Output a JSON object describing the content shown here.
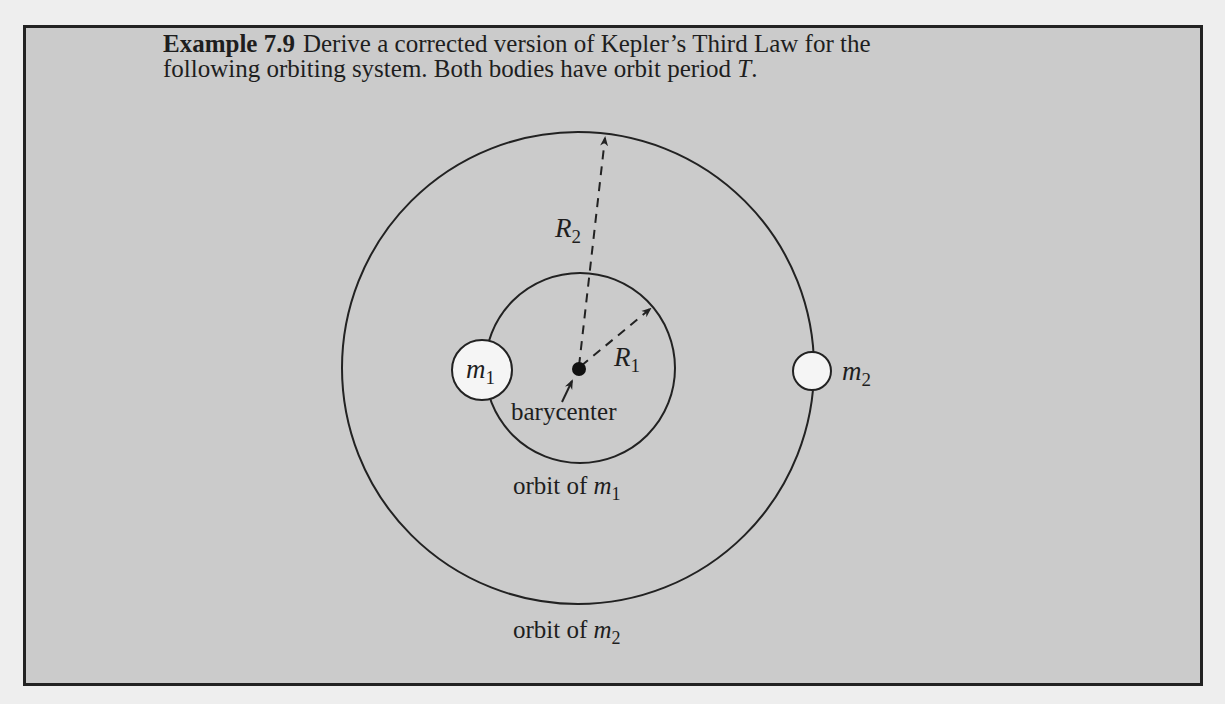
{
  "example": {
    "label": "Example 7.9",
    "text_line1": "Derive a corrected version of Kepler’s Third Law for the",
    "text_line2_prefix": "following orbiting system. Both bodies have orbit period ",
    "text_line2_var": "T",
    "text_line2_suffix": "."
  },
  "diagram": {
    "barycenter": {
      "x": 579,
      "y": 369,
      "label": "barycenter"
    },
    "orbit_m1": {
      "cx": 580,
      "cy": 368,
      "r": 95,
      "label": "orbit of",
      "var": "m",
      "sub": "1"
    },
    "orbit_m2": {
      "cx": 578,
      "cy": 368,
      "r": 236,
      "label": "orbit of",
      "var": "m",
      "sub": "2"
    },
    "body_m1": {
      "cx": 482,
      "cy": 370,
      "r": 30,
      "var": "m",
      "sub": "1"
    },
    "body_m2": {
      "cx": 812,
      "cy": 371,
      "r": 19,
      "var": "m",
      "sub": "2"
    },
    "radius_R1": {
      "var": "R",
      "sub": "1"
    },
    "radius_R2": {
      "var": "R",
      "sub": "2"
    },
    "colors": {
      "page_bg": "#eeeeee",
      "box_bg": "#cbcbcb",
      "stroke": "#222222",
      "body_fill": "#f5f5f5"
    }
  }
}
